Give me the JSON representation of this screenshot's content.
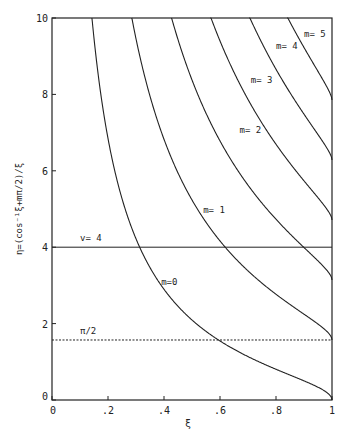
{
  "chart_data": {
    "type": "line",
    "title": "",
    "xlabel": "ξ",
    "ylabel": "η=(cos⁻¹ξ+mπ/2)/ξ",
    "xlim": [
      0,
      1
    ],
    "ylim": [
      0,
      10
    ],
    "grid": false,
    "x_ticks": [
      "0",
      ".2",
      ".4",
      ".6",
      ".8",
      "1"
    ],
    "y_ticks": [
      "0",
      "2",
      "4",
      "6",
      "8",
      "10"
    ],
    "series": [
      {
        "name": "m=0",
        "m": 0,
        "label": "m=0",
        "label_pos": [
          0.39,
          3.0
        ],
        "end_value_at_xi_1": 0
      },
      {
        "name": "m=1",
        "m": 1,
        "label": "m= 1",
        "label_pos": [
          0.54,
          4.9
        ],
        "end_value_at_xi_1": 1.57
      },
      {
        "name": "m=2",
        "m": 2,
        "label": "m= 2",
        "label_pos": [
          0.67,
          7.0
        ],
        "end_value_at_xi_1": 3.14
      },
      {
        "name": "m=3",
        "m": 3,
        "label": "m= 3",
        "label_pos": [
          0.71,
          8.3
        ],
        "end_value_at_xi_1": 4.71
      },
      {
        "name": "m=4",
        "m": 4,
        "label": "m= 4",
        "label_pos": [
          0.8,
          9.2
        ],
        "end_value_at_xi_1": 6.28
      },
      {
        "name": "m=5",
        "m": 5,
        "label": "m= 5",
        "label_pos": [
          0.9,
          9.5
        ],
        "end_value_at_xi_1": 7.85
      }
    ],
    "reference_lines": [
      {
        "name": "v=4",
        "y": 4,
        "style": "solid",
        "label": "v= 4",
        "label_pos": [
          0.1,
          4.15
        ]
      },
      {
        "name": "pi/2",
        "y": 1.5708,
        "style": "dashed",
        "label": "π/2",
        "label_pos": [
          0.1,
          1.72
        ]
      }
    ]
  }
}
